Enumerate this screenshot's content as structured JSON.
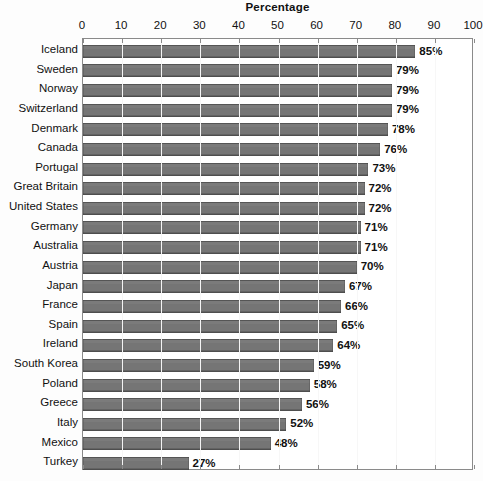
{
  "chart_data": {
    "type": "bar",
    "orientation": "horizontal",
    "title": "Percentage",
    "xlabel": "",
    "ylabel": "",
    "xlim": [
      0,
      100
    ],
    "xticks": [
      0,
      10,
      20,
      30,
      40,
      50,
      60,
      70,
      80,
      90,
      100
    ],
    "xtick_labels": [
      "0",
      "10",
      "20",
      "30",
      "40",
      "50",
      "60",
      "70",
      "80",
      "90",
      "100"
    ],
    "grid": true,
    "grid_axis": "x",
    "legend": false,
    "value_label_suffix": "%",
    "bar_color": "#757575",
    "categories": [
      "Iceland",
      "Sweden",
      "Norway",
      "Switzerland",
      "Denmark",
      "Canada",
      "Portugal",
      "Great Britain",
      "United States",
      "Germany",
      "Australia",
      "Austria",
      "Japan",
      "France",
      "Spain",
      "Ireland",
      "South Korea",
      "Poland",
      "Greece",
      "Italy",
      "Mexico",
      "Turkey"
    ],
    "values": [
      85,
      79,
      79,
      79,
      78,
      76,
      73,
      72,
      72,
      71,
      71,
      70,
      67,
      66,
      65,
      64,
      59,
      58,
      56,
      52,
      48,
      27
    ],
    "value_labels": [
      "85%",
      "79%",
      "79%",
      "79%",
      "78%",
      "76%",
      "73%",
      "72%",
      "72%",
      "71%",
      "71%",
      "70%",
      "67%",
      "66%",
      "65%",
      "64%",
      "59%",
      "58%",
      "56%",
      "52%",
      "48%",
      "27%"
    ]
  }
}
